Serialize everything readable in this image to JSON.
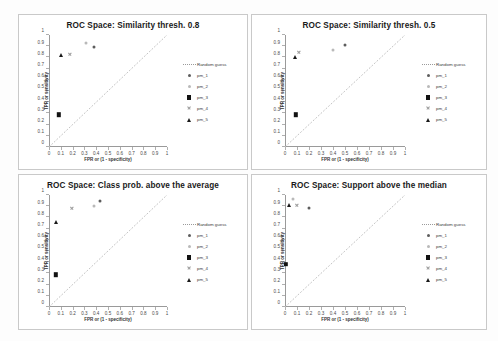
{
  "figure": {
    "layout": "2x2 grid of ROC scatter plots",
    "axis_title_x": "FPR or (1 - specificity)",
    "axis_title_y": "TPR or sensitivity",
    "x_ticks": [
      "0",
      "0.1",
      "0.2",
      "0.3",
      "0.4",
      "0.5",
      "0.6",
      "0.7",
      "0.8",
      "0.9",
      "1"
    ],
    "y_ticks": [
      "0",
      "0.1",
      "0.2",
      "0.3",
      "0.4",
      "0.5",
      "0.6",
      "0.7",
      "0.8",
      "0.9",
      "1"
    ],
    "legend_entries": [
      {
        "label": "Random guess",
        "marker": "dashed-line",
        "color": "#9a9a9a"
      },
      {
        "label": "pm_1",
        "marker": "filled-circle",
        "color": "#5d5d5d"
      },
      {
        "label": "pm_2",
        "marker": "open-circle",
        "color": "#b9b9b9"
      },
      {
        "label": "pm_3",
        "marker": "filled-square",
        "color": "#121212"
      },
      {
        "label": "pm_4",
        "marker": "cross-x",
        "color": "#9d9d9d"
      },
      {
        "label": "pm_5",
        "marker": "filled-triangle",
        "color": "#1a1a1a"
      }
    ]
  },
  "chart_data": [
    {
      "type": "scatter",
      "title": "ROC Space: Similarity thresh. 0.8",
      "xlabel": "FPR or (1 - specificity)",
      "ylabel": "TPR or sensitivity",
      "xlim": [
        0,
        1
      ],
      "ylim": [
        0,
        1
      ],
      "grid": false,
      "legend_position": "right",
      "reference_line": {
        "name": "Random guess",
        "from": [
          0,
          0
        ],
        "to": [
          1,
          1
        ],
        "style": "dotted"
      },
      "series": [
        {
          "name": "pm_1",
          "marker": "filled-circle",
          "x": 0.38,
          "y": 0.895
        },
        {
          "name": "pm_2",
          "marker": "open-circle",
          "x": 0.31,
          "y": 0.93
        },
        {
          "name": "pm_3",
          "marker": "filled-square",
          "x": 0.085,
          "y": 0.29
        },
        {
          "name": "pm_4",
          "marker": "cross-x",
          "x": 0.175,
          "y": 0.825
        },
        {
          "name": "pm_5",
          "marker": "filled-triangle",
          "x": 0.1,
          "y": 0.82
        }
      ]
    },
    {
      "type": "scatter",
      "title": "ROC Space: Similarity thresh. 0.5",
      "xlabel": "FPR or (1 - specificity)",
      "ylabel": "TPR or sensitivity",
      "xlim": [
        0,
        1
      ],
      "ylim": [
        0,
        1
      ],
      "grid": false,
      "legend_position": "right",
      "reference_line": {
        "name": "Random guess",
        "from": [
          0,
          0
        ],
        "to": [
          1,
          1
        ],
        "style": "dotted"
      },
      "series": [
        {
          "name": "pm_1",
          "marker": "filled-circle",
          "x": 0.5,
          "y": 0.915
        },
        {
          "name": "pm_2",
          "marker": "open-circle",
          "x": 0.4,
          "y": 0.865
        },
        {
          "name": "pm_3",
          "marker": "filled-square",
          "x": 0.09,
          "y": 0.29
        },
        {
          "name": "pm_4",
          "marker": "cross-x",
          "x": 0.115,
          "y": 0.845
        },
        {
          "name": "pm_5",
          "marker": "filled-triangle",
          "x": 0.085,
          "y": 0.8
        }
      ]
    },
    {
      "type": "scatter",
      "title": "ROC Space: Class prob. above the average",
      "xlabel": "FPR or (1 - specificity)",
      "ylabel": "TPR or sensitivity",
      "xlim": [
        0,
        1
      ],
      "ylim": [
        0,
        1
      ],
      "grid": false,
      "legend_position": "right",
      "reference_line": {
        "name": "Random guess",
        "from": [
          0,
          0
        ],
        "to": [
          1,
          1
        ],
        "style": "dotted"
      },
      "series": [
        {
          "name": "pm_1",
          "marker": "filled-circle",
          "x": 0.43,
          "y": 0.945
        },
        {
          "name": "pm_2",
          "marker": "open-circle",
          "x": 0.38,
          "y": 0.905
        },
        {
          "name": "pm_3",
          "marker": "filled-square",
          "x": 0.06,
          "y": 0.29
        },
        {
          "name": "pm_4",
          "marker": "cross-x",
          "x": 0.19,
          "y": 0.885
        },
        {
          "name": "pm_5",
          "marker": "filled-triangle",
          "x": 0.06,
          "y": 0.755
        }
      ]
    },
    {
      "type": "scatter",
      "title": "ROC Space: Support above the median",
      "xlabel": "FPR or (1 - specificity)",
      "ylabel": "TPR or sensitivity",
      "xlim": [
        0,
        1
      ],
      "ylim": [
        0,
        1
      ],
      "grid": false,
      "legend_position": "right",
      "reference_line": {
        "name": "Random guess",
        "from": [
          0,
          0
        ],
        "to": [
          1,
          1
        ],
        "style": "dotted"
      },
      "series": [
        {
          "name": "pm_1",
          "marker": "filled-circle",
          "x": 0.2,
          "y": 0.88
        },
        {
          "name": "pm_2",
          "marker": "open-circle",
          "x": 0.07,
          "y": 0.965
        },
        {
          "name": "pm_3",
          "marker": "filled-square",
          "x": 0.005,
          "y": 0.385
        },
        {
          "name": "pm_4",
          "marker": "cross-x",
          "x": 0.095,
          "y": 0.91
        },
        {
          "name": "pm_5",
          "marker": "filled-triangle",
          "x": 0.035,
          "y": 0.915
        }
      ]
    }
  ]
}
